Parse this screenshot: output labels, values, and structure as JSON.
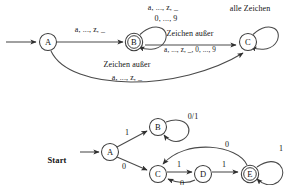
{
  "figure": {
    "type": "finite-state-automata-diagram",
    "language": "de",
    "background_color": "#ffffff",
    "line_color": "#4a4a4a",
    "text_color": "#141414"
  },
  "automaton_top": {
    "name": "identifier-scanner-automaton",
    "states": [
      {
        "id": "A",
        "label": "A",
        "accepting": false,
        "cx": 48,
        "cy": 42,
        "r": 8.5
      },
      {
        "id": "B",
        "label": "B",
        "accepting": true,
        "cx": 134,
        "cy": 42,
        "r": 8.5
      },
      {
        "id": "C",
        "label": "C",
        "accepting": false,
        "cx": 248,
        "cy": 42,
        "r": 8.5
      }
    ],
    "start_arrow": {
      "from_x": 6,
      "to_x": 37,
      "y": 42
    },
    "transitions": [
      {
        "name": "a-to-b",
        "from": "A",
        "to": "B",
        "label_lines": [
          "a, ..., z, _"
        ],
        "label_x": 90,
        "label_y": 30
      },
      {
        "name": "b-self-loop",
        "from": "B",
        "to": "B",
        "label_lines": [
          "a, ..., z, _",
          "0, ..., 9"
        ],
        "label_x": 160,
        "label_y": 8
      },
      {
        "name": "b-to-c",
        "from": "B",
        "to": "C",
        "label_lines": [
          "Zeichen außer",
          "a, ..., z, _, 0, ..., 9"
        ],
        "label_x": 190,
        "label_y": 33
      },
      {
        "name": "a-to-c",
        "from": "A",
        "to": "C",
        "label_lines": [
          "Zeichen außer",
          "a, ..., z, _"
        ],
        "label_x": 125,
        "label_y": 64
      },
      {
        "name": "c-self-loop",
        "from": "C",
        "to": "C",
        "label_lines": [
          "alle Zeichen"
        ],
        "label_x": 248,
        "label_y": 8
      }
    ]
  },
  "automaton_bottom": {
    "name": "binary-string-automaton",
    "start_label": "Start",
    "states": [
      {
        "id": "A",
        "label": "A",
        "accepting": false,
        "cx": 110,
        "cy": 152,
        "r": 8.5
      },
      {
        "id": "B",
        "label": "B",
        "accepting": false,
        "cx": 158,
        "cy": 127,
        "r": 8.5
      },
      {
        "id": "C",
        "label": "C",
        "accepting": false,
        "cx": 158,
        "cy": 174,
        "r": 8.5
      },
      {
        "id": "D",
        "label": "D",
        "accepting": false,
        "cx": 203,
        "cy": 174,
        "r": 8.5
      },
      {
        "id": "E",
        "label": "E",
        "accepting": true,
        "cx": 250,
        "cy": 174,
        "r": 8.5
      }
    ],
    "start_arrow": {
      "from_x": 78,
      "to_x": 100,
      "y": 152
    },
    "transitions": [
      {
        "name": "a-to-b",
        "from": "A",
        "to": "B",
        "label": "1",
        "label_x": 126,
        "label_y": 131
      },
      {
        "name": "a-to-c",
        "from": "A",
        "to": "C",
        "label": "0",
        "label_x": 124,
        "label_y": 166
      },
      {
        "name": "b-self-loop",
        "from": "B",
        "to": "B",
        "label": "0/1",
        "label_x": 191,
        "label_y": 116
      },
      {
        "name": "c-to-d",
        "from": "C",
        "to": "D",
        "label": "1",
        "label_x": 178,
        "label_y": 165
      },
      {
        "name": "d-to-c",
        "from": "D",
        "to": "C",
        "label": "0",
        "label_x": 181,
        "label_y": 183
      },
      {
        "name": "d-to-e",
        "from": "D",
        "to": "E",
        "label": "1",
        "label_x": 224,
        "label_y": 165
      },
      {
        "name": "e-to-c",
        "from": "E",
        "to": "C",
        "label": "0",
        "label_x": 225,
        "label_y": 144
      },
      {
        "name": "e-self-loop",
        "from": "E",
        "to": "E",
        "label": "1",
        "label_x": 279,
        "label_y": 148
      }
    ]
  }
}
